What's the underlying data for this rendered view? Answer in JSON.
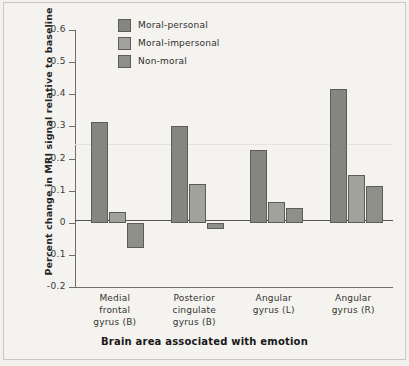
{
  "chart_data": {
    "type": "bar",
    "title": "",
    "xlabel": "Brain area associated with emotion",
    "ylabel": "Percent change in MRI signal relative to baseline",
    "categories": [
      "Medial\nfrontal\ngyrus (B)",
      "Posterior\ncingulate\ngyrus (B)",
      "Angular\ngyrus (L)",
      "Angular\ngyrus (R)"
    ],
    "category_lines": [
      [
        "Medial",
        "frontal",
        "gyrus (B)"
      ],
      [
        "Posterior",
        "cingulate",
        "gyrus (B)"
      ],
      [
        "Angular",
        "gyrus (L)",
        ""
      ],
      [
        "Angular",
        "gyrus (R)",
        ""
      ]
    ],
    "series": [
      {
        "name": "Moral-personal",
        "color": "#868681",
        "values": [
          0.315,
          0.3,
          0.225,
          0.415
        ]
      },
      {
        "name": "Moral-impersonal",
        "color": "#a2a29c",
        "values": [
          0.035,
          0.12,
          0.065,
          0.15
        ]
      },
      {
        "name": "Non-moral",
        "color": "#8f8f8a",
        "values": [
          -0.08,
          -0.02,
          0.045,
          0.115
        ]
      }
    ],
    "ylim": [
      -0.2,
      0.6
    ],
    "yticks": [
      0.6,
      0.5,
      0.4,
      0.3,
      0.2,
      0.1,
      0,
      -0.1,
      -0.2
    ],
    "ytick_labels": [
      "0.6",
      "0.5",
      "0.4",
      "0.3",
      "0.2",
      "0.1",
      "0",
      "-0.1",
      "-0.2"
    ],
    "grid": false,
    "legend_position": "top-left-inside",
    "background": "#f4f3ef",
    "axis_color": "#6e6e6a",
    "baseline_value": 0
  },
  "legend": {
    "items": [
      {
        "label": "Moral-personal"
      },
      {
        "label": "Moral-impersonal"
      },
      {
        "label": "Non-moral"
      }
    ]
  }
}
